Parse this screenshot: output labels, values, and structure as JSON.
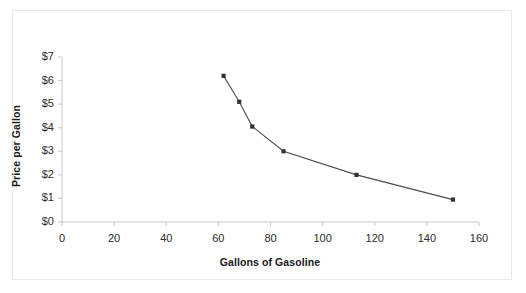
{
  "chart_data": {
    "type": "line",
    "title": "",
    "subtitle": "",
    "xlabel": "Gallons of Gasoline",
    "ylabel": "Price per Gallon",
    "xlim": [
      0,
      160
    ],
    "ylim": [
      0,
      7
    ],
    "xticks": [
      0,
      20,
      40,
      60,
      80,
      100,
      120,
      140,
      160
    ],
    "xtick_labels": [
      "0",
      "20",
      "40",
      "60",
      "80",
      "100",
      "120",
      "140",
      "160"
    ],
    "yticks": [
      0,
      1,
      2,
      3,
      4,
      5,
      6,
      7
    ],
    "ytick_labels": [
      "$0",
      "$1",
      "$2",
      "$3",
      "$4",
      "$5",
      "$6",
      "$7"
    ],
    "grid": false,
    "legend": false,
    "legend_position": "none",
    "marker": "square",
    "line_color": "#4d4d4d",
    "marker_color": "#333333",
    "series": [
      {
        "name": "Demand",
        "x": [
          62,
          68,
          73,
          85,
          113,
          150
        ],
        "y": [
          6.2,
          5.1,
          4.05,
          3.0,
          2.0,
          0.95
        ]
      }
    ],
    "points": [
      {
        "x": 62,
        "y": 6.2
      },
      {
        "x": 68,
        "y": 5.1
      },
      {
        "x": 73,
        "y": 4.05
      },
      {
        "x": 85,
        "y": 3.0
      },
      {
        "x": 113,
        "y": 2.0
      },
      {
        "x": 150,
        "y": 0.95
      }
    ],
    "annotations": []
  }
}
